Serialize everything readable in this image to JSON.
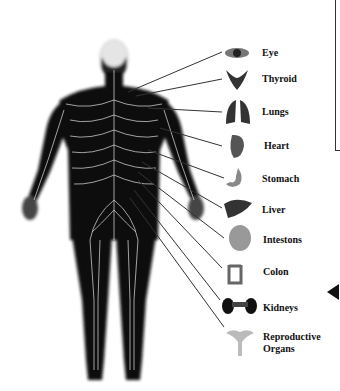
{
  "diagram": {
    "figure": "human-back-nervous-system",
    "organs": [
      {
        "label": "Eye",
        "icon": "eye-icon",
        "y": 52
      },
      {
        "label": "Thyroid",
        "icon": "thyroid-icon",
        "y": 79
      },
      {
        "label": "Lungs",
        "icon": "lungs-icon",
        "y": 112
      },
      {
        "label": "Heart",
        "icon": "heart-icon",
        "y": 146
      },
      {
        "label": "Stomach",
        "icon": "stomach-icon",
        "y": 178
      },
      {
        "label": "Liver",
        "icon": "liver-icon",
        "y": 210
      },
      {
        "label": "Intestons",
        "icon": "intestines-icon",
        "y": 239
      },
      {
        "label": "Colon",
        "icon": "colon-icon",
        "y": 271
      },
      {
        "label": "Kidneys",
        "icon": "kidneys-icon",
        "y": 308
      },
      {
        "label": "Reproductive",
        "label2": "Organs",
        "icon": "reproductive-organs-icon",
        "y": 337
      }
    ],
    "colors": {
      "body": "#111111",
      "nerves": "#e8e8e8",
      "lines": "#333333",
      "organ": "#555555"
    }
  }
}
